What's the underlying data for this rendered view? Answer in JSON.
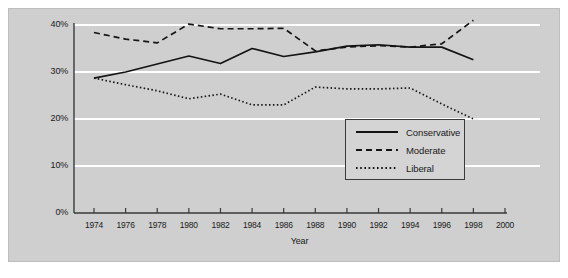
{
  "chart_data": {
    "type": "line",
    "title": "",
    "subtitle": "",
    "xlabel": "Year",
    "ylabel": "",
    "xlim": [
      1973,
      2000
    ],
    "ylim": [
      0,
      40
    ],
    "grid": "horizontal",
    "legend_position": "inside-bottom-right",
    "x": [
      1974,
      1976,
      1978,
      1980,
      1982,
      1984,
      1986,
      1988,
      1990,
      1992,
      1994,
      1996,
      1998
    ],
    "xticks": [
      "1974",
      "1976",
      "1978",
      "1980",
      "1982",
      "1984",
      "1986",
      "1988",
      "1990",
      "1992",
      "1994",
      "1996",
      "1998",
      "2000"
    ],
    "xtick_values": [
      1974,
      1976,
      1978,
      1980,
      1982,
      1984,
      1986,
      1988,
      1990,
      1992,
      1994,
      1996,
      1998,
      2000
    ],
    "yticks": [
      "0%",
      "10%",
      "20%",
      "30%",
      "40%"
    ],
    "ytick_values": [
      0,
      10,
      20,
      30,
      40
    ],
    "series": [
      {
        "name": "Conservative",
        "style": "solid",
        "color": "#141414",
        "values": [
          28.7,
          30.0,
          31.7,
          33.4,
          31.8,
          35.0,
          33.3,
          34.3,
          35.5,
          35.8,
          35.3,
          35.3,
          32.6
        ]
      },
      {
        "name": "Moderate",
        "style": "dashed",
        "color": "#141414",
        "values": [
          38.4,
          37.0,
          36.2,
          40.2,
          39.2,
          39.2,
          39.3,
          34.5,
          35.3,
          35.6,
          35.3,
          36.0,
          41.0
        ]
      },
      {
        "name": "Liberal",
        "style": "dotted",
        "color": "#141414",
        "values": [
          28.7,
          27.3,
          26.0,
          24.3,
          25.3,
          23.0,
          23.0,
          26.8,
          26.4,
          26.4,
          26.6,
          23.2,
          20.0
        ]
      }
    ]
  },
  "legend": {
    "entries": [
      {
        "label": "Conservative",
        "style": "solid"
      },
      {
        "label": "Moderate",
        "style": "dashed"
      },
      {
        "label": "Liberal",
        "style": "dotted"
      }
    ]
  },
  "axes": {
    "x_axis_title": "Year",
    "y_tick_labels": [
      "40%",
      "30%",
      "20%",
      "10%",
      "0%"
    ],
    "x_tick_labels": [
      "1974",
      "1976",
      "1978",
      "1980",
      "1982",
      "1984",
      "1986",
      "1988",
      "1990",
      "1992",
      "1994",
      "1996",
      "1998",
      "2000"
    ]
  },
  "colors": {
    "panel_background": "#cfcfcf",
    "figure_background": "#ffffff",
    "gridline": "#ffffff",
    "axis_line": "#3a3a3a",
    "series_line": "#141414",
    "legend_background": "#d4d4d4",
    "legend_border": "#3a3a3a",
    "text": "#1a1a1a"
  }
}
